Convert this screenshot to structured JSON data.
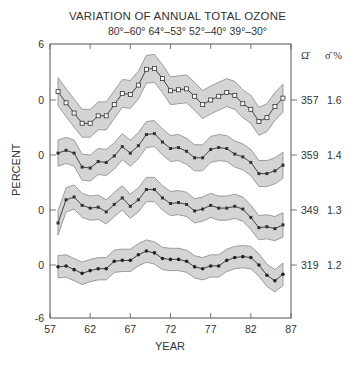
{
  "chart_data": {
    "type": "line",
    "title": "VARIATION OF ANNUAL TOTAL OZONE",
    "subtitle": "80°–60°  64°–53°  52°–40°  39°–30°",
    "xlabel": "YEAR",
    "ylabel": "PERCENT",
    "xlim": [
      57,
      87
    ],
    "x_ticks": [
      "57",
      "62",
      "67",
      "72",
      "77",
      "82",
      "87"
    ],
    "y_tick_labels": [
      "6",
      "0",
      "0",
      "0",
      "0",
      "-6"
    ],
    "grid": false,
    "right_column_headers": [
      "Ω̄",
      "σ̄ %"
    ],
    "x": [
      58,
      59,
      60,
      61,
      62,
      63,
      64,
      65,
      66,
      67,
      68,
      69,
      70,
      71,
      72,
      73,
      74,
      75,
      76,
      77,
      78,
      79,
      80,
      81,
      82,
      83,
      84,
      85,
      86
    ],
    "series": [
      {
        "name": "80°–60°",
        "mean_ozone": "357",
        "sigma_percent": "1.6",
        "marker": "open-square",
        "band_halfwidth": 1.5,
        "values": [
          0.9,
          -0.3,
          -1.4,
          -2.5,
          -2.5,
          -1.7,
          -1.7,
          -0.5,
          0.7,
          0.6,
          1.6,
          3.3,
          3.4,
          2.3,
          1.0,
          1.1,
          1.2,
          0.4,
          -0.5,
          0.0,
          0.4,
          0.8,
          0.5,
          -0.4,
          -1.0,
          -2.3,
          -1.9,
          -0.7,
          0.2
        ]
      },
      {
        "name": "64°–53°",
        "mean_ozone": "359",
        "sigma_percent": "1.4",
        "marker": "filled-square",
        "band_halfwidth": 1.4,
        "values": [
          0.2,
          0.5,
          0.2,
          -1.3,
          -1.4,
          -0.7,
          -0.8,
          -0.1,
          0.9,
          0.2,
          1.0,
          2.2,
          2.3,
          1.4,
          0.7,
          0.8,
          0.4,
          -0.3,
          -0.3,
          0.6,
          0.8,
          0.7,
          0.1,
          -0.2,
          -0.8,
          -2.0,
          -2.0,
          -1.7,
          -1.1
        ]
      },
      {
        "name": "52°–40°",
        "mean_ozone": "349",
        "sigma_percent": "1.3",
        "marker": "filled-square",
        "band_halfwidth": 1.3,
        "values": [
          -1.4,
          1.1,
          1.4,
          0.5,
          0.2,
          0.3,
          -0.2,
          0.6,
          1.3,
          0.4,
          1.1,
          2.2,
          2.2,
          1.3,
          0.7,
          0.8,
          0.6,
          -0.1,
          0.1,
          0.5,
          0.2,
          0.2,
          0.4,
          0.1,
          -0.8,
          -1.9,
          -1.8,
          -2.0,
          -1.6
        ]
      },
      {
        "name": "39°–30°",
        "mean_ozone": "319",
        "sigma_percent": "1.2",
        "marker": "filled-circle",
        "band_halfwidth": 1.2,
        "values": [
          -0.2,
          -0.1,
          -0.5,
          -0.9,
          -0.6,
          -0.4,
          -0.4,
          0.4,
          0.5,
          0.5,
          1.1,
          1.5,
          1.3,
          0.7,
          0.6,
          0.6,
          0.4,
          -0.2,
          -0.4,
          -0.1,
          -0.1,
          0.5,
          0.8,
          0.9,
          0.8,
          0.0,
          -1.1,
          -1.7,
          -1.0
        ]
      }
    ]
  },
  "colors": {
    "axis": "#555555",
    "band_fill": "#d4d4d4",
    "band_edge": "#888888",
    "line": "#333333",
    "text": "#333333"
  }
}
